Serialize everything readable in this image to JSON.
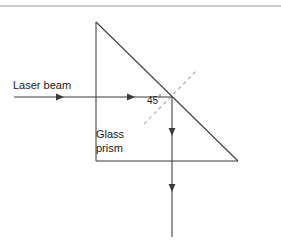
{
  "figure": {
    "labels": {
      "laser_beam": "Laser beam",
      "glass_prism_line1": "Glass",
      "glass_prism_line2": "prism",
      "angle_value": "45",
      "angle_degree_symbol": "°"
    },
    "colors": {
      "stroke": "#3a3a3a",
      "dashed_stroke": "#9a9a9a",
      "rule": "#9a9a9a",
      "background": "#ffffff",
      "text": "#1a1a1a"
    },
    "geometry": {
      "top_rule_y": 6,
      "prism_apex": [
        96,
        22
      ],
      "prism_bottom_left": [
        96,
        161
      ],
      "prism_bottom_right": [
        238,
        161
      ],
      "incident_ray_start": [
        14,
        97
      ],
      "incident_ray_end": [
        172,
        97
      ],
      "incident_arrow_positions_x": [
        62,
        133
      ],
      "reflection_point": [
        172,
        97
      ],
      "reflected_ray_start": [
        172,
        97
      ],
      "reflected_ray_end": [
        172,
        237
      ],
      "reflected_arrow_positions_y": [
        134,
        190
      ],
      "normal_dashed_start": [
        144,
        124
      ],
      "normal_dashed_end": [
        196,
        71
      ]
    }
  }
}
